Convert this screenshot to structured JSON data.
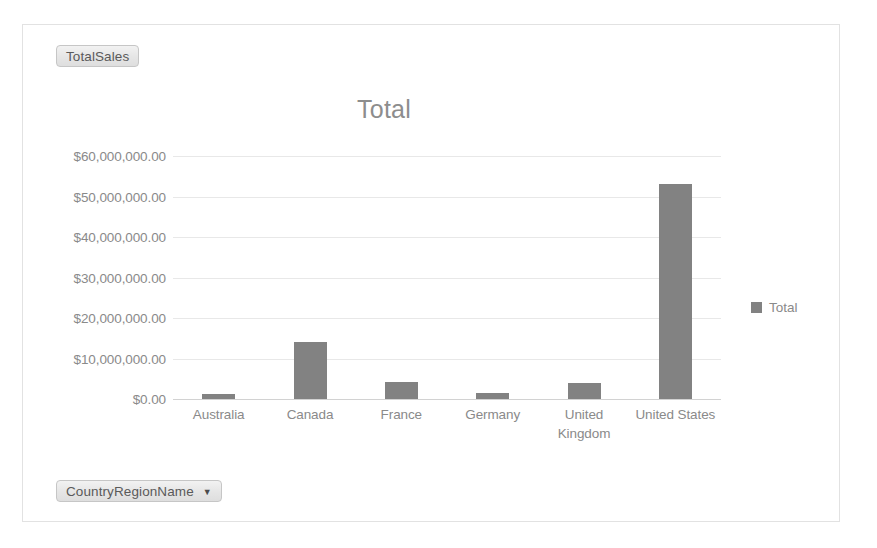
{
  "pivot": {
    "values_field": {
      "label": "TotalSales"
    },
    "axis_field": {
      "label": "CountryRegionName",
      "caret": "▼"
    }
  },
  "legend": {
    "position": "right",
    "entries": [
      {
        "label": "Total",
        "color": "#828282"
      }
    ]
  },
  "colors": {
    "bar": "#828282",
    "gridline": "#e8e8e8",
    "axis": "#d2d2d2",
    "text": "#8a8a8a",
    "title": "#8d8d8d",
    "frame": "#e2e2e2",
    "button_text": "#5a5a5a"
  },
  "chart_data": {
    "type": "bar",
    "title": "Total",
    "xlabel": "",
    "ylabel": "",
    "categories": [
      "Australia",
      "Canada",
      "France",
      "Germany",
      "United Kingdom",
      "United States"
    ],
    "series": [
      {
        "name": "Total",
        "values": [
          1300000,
          14000000,
          4300000,
          1600000,
          4000000,
          53000000
        ]
      }
    ],
    "ylim": [
      0,
      60000000
    ],
    "ytick_values": [
      0,
      10000000,
      20000000,
      30000000,
      40000000,
      50000000,
      60000000
    ],
    "ytick_labels": [
      "$0.00",
      "$10,000,000.00",
      "$20,000,000.00",
      "$30,000,000.00",
      "$40,000,000.00",
      "$50,000,000.00",
      "$60,000,000.00"
    ],
    "grid": true,
    "legend_position": "right"
  }
}
